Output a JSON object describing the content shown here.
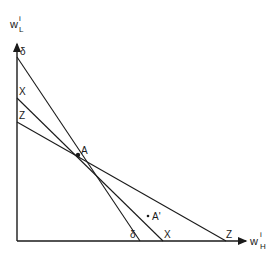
{
  "diagram": {
    "y_axis_label": {
      "base": "w",
      "sub": "L",
      "sup": "i"
    },
    "x_axis_label": {
      "base": "w",
      "sub": "H",
      "sup": "i"
    },
    "lines": [
      {
        "name": "delta",
        "label": "δ",
        "y_intercept": [
          17,
          57
        ],
        "x_intercept": [
          140,
          241
        ]
      },
      {
        "name": "X",
        "label": "X",
        "y_intercept": [
          17,
          98
        ],
        "x_intercept": [
          163,
          241
        ]
      },
      {
        "name": "Z",
        "label": "Z",
        "y_intercept": [
          17,
          122
        ],
        "x_intercept": [
          226,
          241
        ]
      }
    ],
    "points": [
      {
        "name": "A",
        "label": "A",
        "x": 78,
        "y": 155
      },
      {
        "name": "A-prime",
        "label": "A'",
        "x": 152,
        "y": 216
      }
    ],
    "colors": {
      "line": "#1a1a1a",
      "background": "#ffffff"
    }
  }
}
